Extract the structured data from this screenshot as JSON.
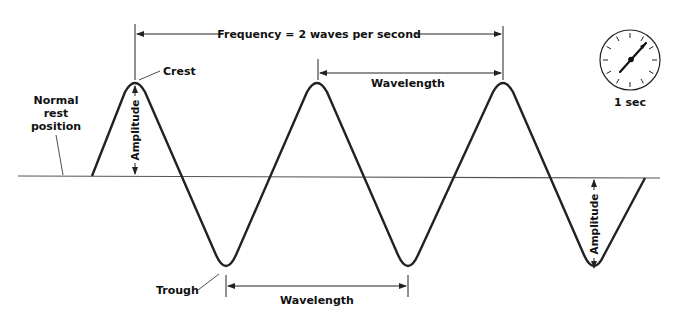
{
  "diagram": {
    "colors": {
      "line": "#222222",
      "text": "#111111",
      "background": "#ffffff",
      "baseline": "#555555"
    },
    "labels": {
      "frequency": "Frequency = 2 waves per second",
      "wavelength_top": "Wavelength",
      "wavelength_bottom": "Wavelength",
      "crest": "Crest",
      "trough": "Trough",
      "amplitude_left": "Amplitude",
      "amplitude_right": "Amplitude",
      "rest_line1": "Normal",
      "rest_line2": "rest",
      "rest_line3": "position",
      "clock_caption": "1 sec"
    },
    "clock_icon": "stopwatch-clock-icon"
  }
}
